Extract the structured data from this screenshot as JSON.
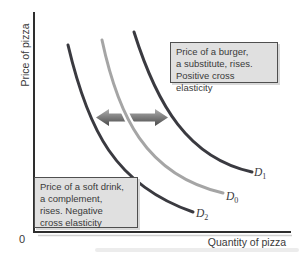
{
  "diagram": {
    "y_axis_label": "Price of pizza",
    "x_axis_label": "Quantity of pizza",
    "origin_label": "0",
    "boxes": {
      "substitute": {
        "lines": [
          "Price of a burger,",
          "a substitute, rises.",
          "Positive cross elasticity"
        ]
      },
      "complement": {
        "lines": [
          "Price of a soft drink,",
          "a complement,",
          "rises. Negative",
          "cross elasticity"
        ]
      }
    },
    "curve_labels": {
      "d1": {
        "base": "D",
        "sub": "1"
      },
      "d0": {
        "base": "D",
        "sub": "0"
      },
      "d2": {
        "base": "D",
        "sub": "2"
      }
    },
    "colors": {
      "dark_curve": "#3a3a40",
      "light_curve": "#a5a5a5",
      "axis": "#2e2e2e",
      "axis_shadow": "#cfcfcf",
      "arrow_light": "#aeaeae",
      "arrow_dark": "#4a4a4a",
      "box_bg": "#e0e0e0",
      "box_border": "#4f4f4f"
    }
  }
}
